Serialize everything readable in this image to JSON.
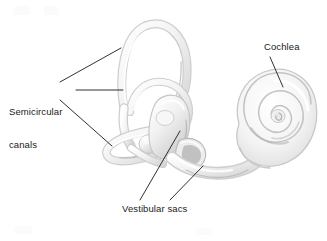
{
  "figure": {
    "background_color": "#ffffff",
    "width": 327,
    "height": 241
  },
  "labels": {
    "semicircular_canals": {
      "line1": "Semicircular",
      "line2": "canals"
    },
    "cochlea": "Cochlea",
    "vestibular_sacs": "Vestibular sacs"
  },
  "style": {
    "text_color": "#1a1a1a",
    "leader_color": "#1a1a1a",
    "structure_outline": "#c9c9c9",
    "structure_fill": "#f4f4f4",
    "structure_shadow": "#a9a9a9",
    "font_size_px": 9.5
  },
  "leaders": [
    {
      "name": "semicircular-canals-upper",
      "from": [
        60,
        82
      ],
      "to": [
        121,
        48
      ]
    },
    {
      "name": "semicircular-canals-middle",
      "from": [
        76,
        90
      ],
      "to": [
        123,
        90
      ]
    },
    {
      "name": "semicircular-canals-lower",
      "from": [
        60,
        100
      ],
      "to": [
        112,
        146
      ]
    },
    {
      "name": "cochlea",
      "from": [
        270,
        57
      ],
      "to": [
        283,
        87
      ]
    },
    {
      "name": "vestibular-sacs-left",
      "from": [
        140,
        200
      ],
      "to": [
        180,
        131
      ]
    },
    {
      "name": "vestibular-sacs-right",
      "from": [
        170,
        200
      ],
      "to": [
        203,
        166
      ]
    }
  ],
  "structures": [
    {
      "name": "superior-semicircular-canal",
      "kind": "arch-loop"
    },
    {
      "name": "posterior-semicircular-canal",
      "kind": "arch-loop"
    },
    {
      "name": "lateral-semicircular-canal",
      "kind": "horizontal-loop"
    },
    {
      "name": "vestibule",
      "kind": "bulb"
    },
    {
      "name": "ampulla",
      "kind": "bulb"
    },
    {
      "name": "oval-window",
      "kind": "opening"
    },
    {
      "name": "cochlea",
      "kind": "spiral"
    }
  ]
}
